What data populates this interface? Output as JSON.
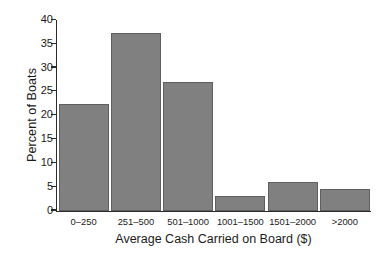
{
  "chart_data": {
    "type": "bar",
    "title": "",
    "xlabel": "Average Cash Carried on Board ($)",
    "ylabel": "Percent of Boats",
    "categories": [
      "0–250",
      "251–500",
      "501–1000",
      "1001–1500",
      "1501–2000",
      ">2000"
    ],
    "values": [
      22.3,
      37.3,
      27.0,
      3.0,
      6.0,
      4.5
    ],
    "ylim": [
      0,
      40
    ],
    "yticks": [
      0,
      5,
      10,
      15,
      20,
      25,
      30,
      35,
      40
    ],
    "ytick_labels": [
      "0",
      "5",
      "10",
      "15",
      "20",
      "25",
      "30",
      "35",
      "40"
    ],
    "grid": false,
    "legend": false,
    "bar_color": "#808080",
    "bar_edge_color": "#5f5f5f",
    "axis_color": "#2b2b2b",
    "background_color": "#ffffff"
  }
}
